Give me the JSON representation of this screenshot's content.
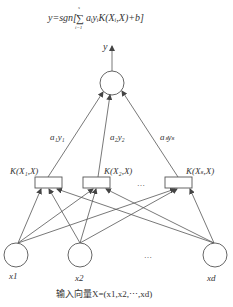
{
  "diagram": {
    "type": "svm-network",
    "formula": {
      "prefix": "y=sgn[",
      "sum_symbol": "∑",
      "sum_upper": "s",
      "sum_lower": "i=1",
      "body": "aᵢyᵢK(Xᵢ,X)+b]"
    },
    "output": {
      "label": "y"
    },
    "weights": [
      {
        "label": "a₁y₁"
      },
      {
        "label": "a₂y₂"
      },
      {
        "label": "aₛyₛ"
      }
    ],
    "kernels": [
      {
        "label": "K(X₁,X)"
      },
      {
        "label": "K(X₂,X)"
      },
      {
        "label": "K(Xₛ,X)"
      }
    ],
    "kernel_ellipsis": "…",
    "inputs": [
      {
        "label": "x1"
      },
      {
        "label": "x2"
      },
      {
        "label": "xd"
      }
    ],
    "input_ellipsis": "…",
    "caption": "输入向量X=(x1,x2,⋯,xd)"
  }
}
